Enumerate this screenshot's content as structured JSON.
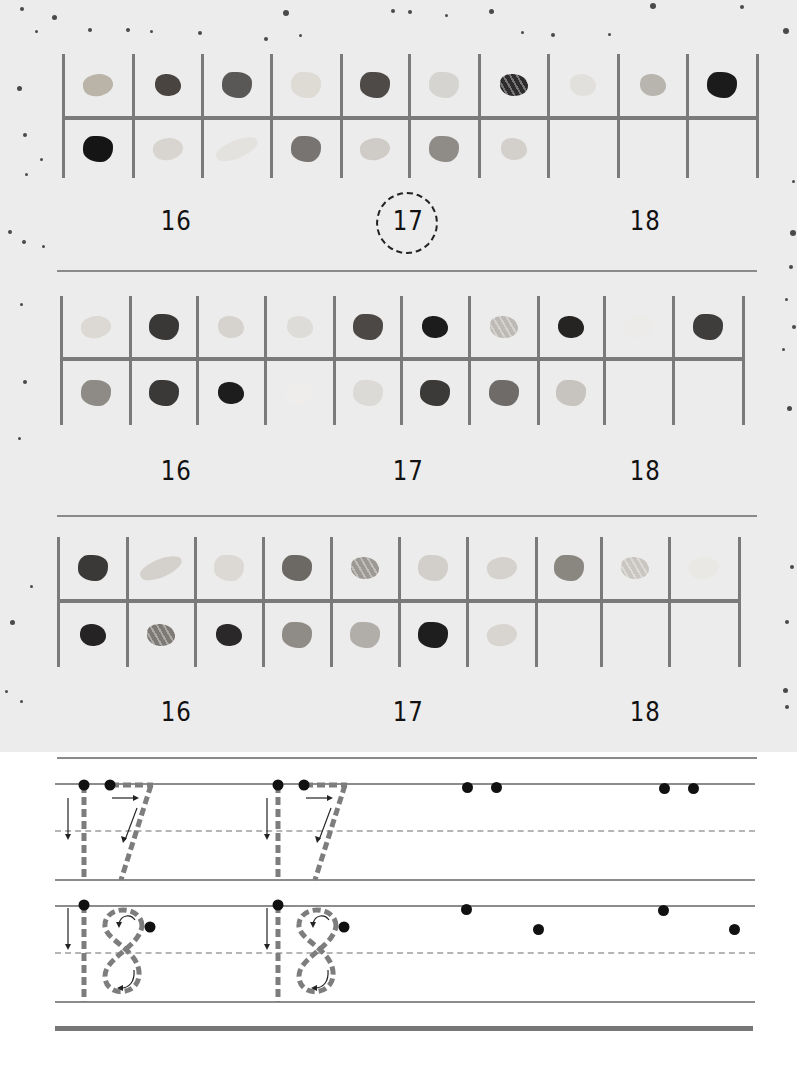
{
  "worksheet": {
    "sections": [
      {
        "id": "set-1",
        "rocks_row1": [
          {
            "tone": "#b9b3a8",
            "shape": "flake"
          },
          {
            "tone": "#4a4440",
            "shape": "tumbled"
          },
          {
            "tone": "#5a5856",
            "shape": "chunk"
          },
          {
            "tone": "#dedbd5",
            "shape": "chunk"
          },
          {
            "tone": "#4d4a48",
            "shape": "chunk"
          },
          {
            "tone": "#d6d4d0",
            "shape": "chunk"
          },
          {
            "tone": "#2e2c2c",
            "shape": "banded"
          },
          {
            "tone": "#e2e0dd",
            "shape": "tumbled"
          },
          {
            "tone": "#b8b4ae",
            "shape": "tumbled"
          },
          {
            "tone": "#1c1b1b",
            "shape": "chunk"
          }
        ],
        "rocks_row2": [
          {
            "tone": "#161515",
            "shape": "chunk"
          },
          {
            "tone": "#d8d5d0",
            "shape": "flake"
          },
          {
            "tone": "#e4e2df",
            "shape": "crystal"
          },
          {
            "tone": "#777471",
            "shape": "chunk"
          },
          {
            "tone": "#cfccc7",
            "shape": "flake"
          },
          {
            "tone": "#8f8c88",
            "shape": "chunk"
          },
          {
            "tone": "#d3cfca",
            "shape": "tumbled"
          }
        ],
        "rock_count": 17,
        "options": [
          "16",
          "17",
          "18"
        ],
        "selected": "17"
      },
      {
        "id": "set-2",
        "rocks_row1": [
          {
            "tone": "#dcd8d3",
            "shape": "flake"
          },
          {
            "tone": "#3a3836",
            "shape": "chunk"
          },
          {
            "tone": "#d6d3cf",
            "shape": "tumbled"
          },
          {
            "tone": "#dedcd9",
            "shape": "tumbled"
          },
          {
            "tone": "#4b4846",
            "shape": "chunk"
          },
          {
            "tone": "#1d1c1c",
            "shape": "tumbled"
          },
          {
            "tone": "#bdb9b4",
            "shape": "banded"
          },
          {
            "tone": "#262423",
            "shape": "tumbled"
          },
          {
            "tone": "#ecebe9",
            "shape": "flake"
          },
          {
            "tone": "#3f3d3b",
            "shape": "chunk"
          }
        ],
        "rocks_row2": [
          {
            "tone": "#8e8a85",
            "shape": "chunk"
          },
          {
            "tone": "#3b3937",
            "shape": "chunk"
          },
          {
            "tone": "#1e1d1d",
            "shape": "tumbled"
          },
          {
            "tone": "#eeedeb",
            "shape": "flake"
          },
          {
            "tone": "#dcdad6",
            "shape": "chunk"
          },
          {
            "tone": "#3c3a38",
            "shape": "chunk"
          },
          {
            "tone": "#6e6b68",
            "shape": "chunk"
          },
          {
            "tone": "#c7c3be",
            "shape": "chunk"
          }
        ],
        "rock_count": 18,
        "options": [
          "16",
          "17",
          "18"
        ],
        "selected": null
      },
      {
        "id": "set-3",
        "rocks_row1": [
          {
            "tone": "#3b3937",
            "shape": "chunk"
          },
          {
            "tone": "#d4d1cc",
            "shape": "crystal"
          },
          {
            "tone": "#dcd9d5",
            "shape": "chunk"
          },
          {
            "tone": "#6c6864",
            "shape": "chunk"
          },
          {
            "tone": "#9c9893",
            "shape": "banded"
          },
          {
            "tone": "#d2cfca",
            "shape": "chunk"
          },
          {
            "tone": "#d5d2ce",
            "shape": "flake"
          },
          {
            "tone": "#8a8680",
            "shape": "chunk"
          },
          {
            "tone": "#c9c6c1",
            "shape": "banded"
          },
          {
            "tone": "#eae8e5",
            "shape": "flake"
          }
        ],
        "rocks_row2": [
          {
            "tone": "#252323",
            "shape": "tumbled"
          },
          {
            "tone": "#7d7975",
            "shape": "banded"
          },
          {
            "tone": "#2a2828",
            "shape": "tumbled"
          },
          {
            "tone": "#8f8b86",
            "shape": "chunk"
          },
          {
            "tone": "#b1ada8",
            "shape": "chunk"
          },
          {
            "tone": "#1f1e1e",
            "shape": "chunk"
          },
          {
            "tone": "#d8d5d1",
            "shape": "flake"
          }
        ],
        "rock_count": 17,
        "options": [
          "16",
          "17",
          "18"
        ],
        "selected": null
      }
    ],
    "tracing": {
      "digits": [
        {
          "label": "17",
          "traced_copies": 2,
          "start_dots": 2
        },
        {
          "label": "18",
          "traced_copies": 2,
          "start_dots": 2
        }
      ]
    },
    "colors": {
      "grid_line": "#7a7a7a",
      "trace_stroke": "#7d7d7d",
      "ink": "#111111",
      "photo_bg": "#ececec",
      "paper_bg": "#ffffff"
    }
  }
}
